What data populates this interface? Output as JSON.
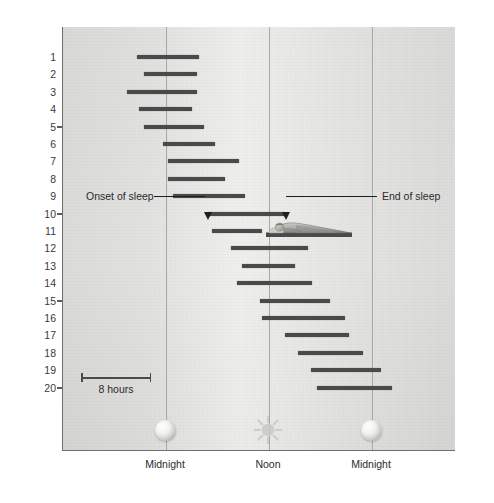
{
  "chart_data": {
    "type": "bar",
    "title": "",
    "subtitle": "",
    "ylabel": "Days Spent in Continuously Light Environment",
    "xlabel": "",
    "xlim_hours": [
      -6,
      40
    ],
    "ylim": [
      0.5,
      20.5
    ],
    "grid": true,
    "legend": null,
    "x_tick_labels": [
      "Midnight",
      "Noon",
      "Midnight"
    ],
    "x_tick_hours": [
      0,
      12,
      24
    ],
    "y_tick_labels": [
      "5",
      "10",
      "15",
      "20"
    ],
    "y_tick_values": [
      5,
      10,
      15,
      20
    ],
    "categories": [
      "1",
      "2",
      "3",
      "4",
      "5",
      "6",
      "7",
      "8",
      "9",
      "10",
      "11",
      "12",
      "13",
      "14",
      "15",
      "16",
      "17",
      "18",
      "19",
      "20"
    ],
    "scalebar": {
      "label": "8 hours",
      "hours": 8
    },
    "annotations": [
      {
        "name": "onset-of-sleep",
        "text": "Onset of sleep"
      },
      {
        "name": "end-of-sleep",
        "text": "End of sleep"
      }
    ],
    "series": [
      {
        "name": "Sleep episode",
        "units": "hours from first midnight",
        "bars": [
          {
            "day": 1,
            "start": -3.4,
            "end": 3.8
          },
          {
            "day": 2,
            "start": -2.6,
            "end": 3.6
          },
          {
            "day": 3,
            "start": -4.5,
            "end": 3.6
          },
          {
            "day": 4,
            "start": -3.1,
            "end": 3.0
          },
          {
            "day": 5,
            "start": -2.6,
            "end": 4.4
          },
          {
            "day": 6,
            "start": -0.3,
            "end": 5.7
          },
          {
            "day": 7,
            "start": 0.2,
            "end": 8.5
          },
          {
            "day": 8,
            "start": 0.2,
            "end": 6.9
          },
          {
            "day": 9,
            "start": 0.8,
            "end": 9.2
          },
          {
            "day": 10,
            "start": 4.9,
            "end": 14.0
          },
          {
            "day": 11,
            "start": 5.4,
            "end": 11.2
          },
          {
            "day": 12,
            "start": 7.6,
            "end": 16.6
          },
          {
            "day": 13,
            "start": 8.9,
            "end": 15.0
          },
          {
            "day": 14,
            "start": 8.3,
            "end": 17.0
          },
          {
            "day": 15,
            "start": 11.0,
            "end": 19.1
          },
          {
            "day": 16,
            "start": 11.2,
            "end": 20.9
          },
          {
            "day": 17,
            "start": 13.9,
            "end": 21.3
          },
          {
            "day": 18,
            "start": 15.4,
            "end": 22.9
          },
          {
            "day": 19,
            "start": 16.9,
            "end": 25.1
          },
          {
            "day": 20,
            "start": 17.6,
            "end": 26.3
          }
        ]
      }
    ]
  },
  "axis": {
    "y_title": "Days Spent in Continuously Light Environment",
    "y_ticks": [
      {
        "label": "1"
      },
      {
        "label": "2"
      },
      {
        "label": "3"
      },
      {
        "label": "4"
      },
      {
        "label": "5"
      },
      {
        "label": "6"
      },
      {
        "label": "7"
      },
      {
        "label": "8"
      },
      {
        "label": "9"
      },
      {
        "label": "10"
      },
      {
        "label": "11"
      },
      {
        "label": "12"
      },
      {
        "label": "13"
      },
      {
        "label": "14"
      },
      {
        "label": "15"
      },
      {
        "label": "16"
      },
      {
        "label": "17"
      },
      {
        "label": "18"
      },
      {
        "label": "19"
      },
      {
        "label": "20"
      }
    ],
    "x_ticks": [
      {
        "label": "Midnight",
        "icon": "moon-icon"
      },
      {
        "label": "Noon",
        "icon": "sun-icon"
      },
      {
        "label": "Midnight",
        "icon": "moon-icon"
      }
    ]
  },
  "scalebar": {
    "label": "8 hours"
  },
  "annotations": {
    "onset": "Onset of sleep",
    "end": "End of sleep"
  },
  "colors": {
    "bar": "#4a4a4a",
    "panel_top": "#d9d9d7",
    "panel_bottom": "#d4d4d2",
    "gridline": "#a8a8a6",
    "axis": "#6f6f6f",
    "text": "#2b2b2b"
  }
}
